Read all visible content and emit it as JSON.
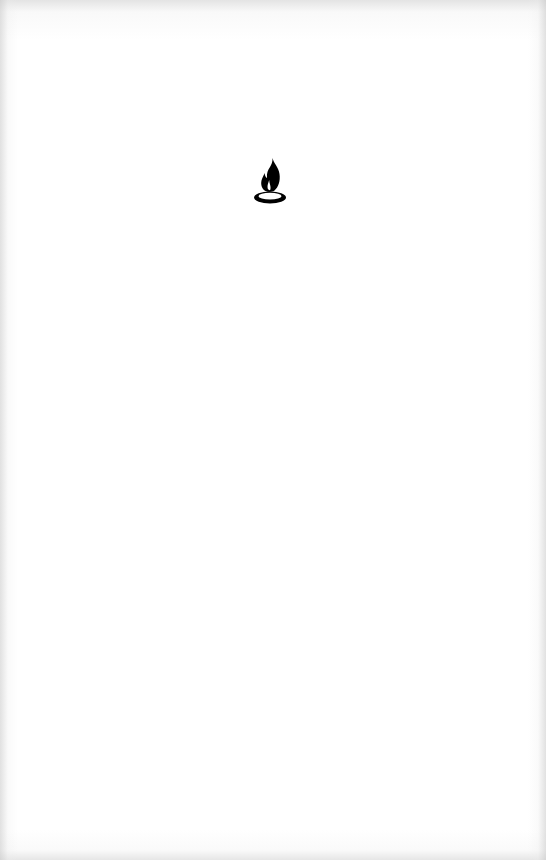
{
  "screen": {
    "type": "splash",
    "background_color": "#ffffff",
    "edge_shade_color": "#d0d0d0"
  },
  "logo": {
    "icon": "flame-on-ring-icon",
    "color": "#000000",
    "label": ""
  }
}
